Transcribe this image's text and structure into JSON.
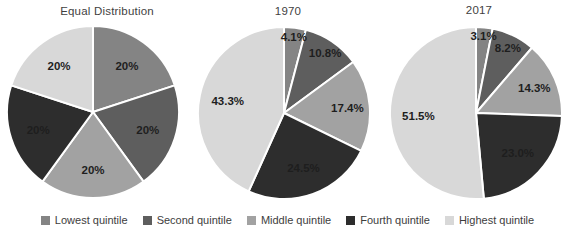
{
  "panel": {
    "background": "#ffffff",
    "label_color": "#1e1e1e",
    "divider_color": "#ffffff",
    "title_color": "#3f3f3f"
  },
  "legend": {
    "position": "bottom",
    "items": [
      {
        "label": "Lowest quintile",
        "color": "#848484"
      },
      {
        "label": "Second quintile",
        "color": "#5e5e5e"
      },
      {
        "label": "Middle quintile",
        "color": "#a2a2a2"
      },
      {
        "label": "Fourth quintile",
        "color": "#2d2d2d"
      },
      {
        "label": "Highest quintile",
        "color": "#d8d8d8"
      }
    ]
  },
  "chart_data": [
    {
      "type": "pie",
      "title": "Equal Distribution",
      "categories": [
        "Lowest quintile",
        "Second quintile",
        "Middle quintile",
        "Fourth quintile",
        "Highest quintile"
      ],
      "values": [
        20,
        20,
        20,
        20,
        20
      ],
      "labels": [
        "20%",
        "20%",
        "20%",
        "20%",
        "20%"
      ],
      "colors": [
        "#848484",
        "#5e5e5e",
        "#a2a2a2",
        "#2d2d2d",
        "#d8d8d8"
      ],
      "start_angle_deg": 0,
      "direction": "clockwise",
      "legend_position": "bottom"
    },
    {
      "type": "pie",
      "title": "1970",
      "categories": [
        "Lowest quintile",
        "Second quintile",
        "Middle quintile",
        "Fourth quintile",
        "Highest quintile"
      ],
      "values": [
        4.1,
        10.8,
        17.4,
        24.5,
        43.3
      ],
      "labels": [
        "4.1%",
        "10.8%",
        "17.4%",
        "24.5%",
        "43.3%"
      ],
      "colors": [
        "#848484",
        "#5e5e5e",
        "#a2a2a2",
        "#2d2d2d",
        "#d8d8d8"
      ],
      "start_angle_deg": 0,
      "direction": "clockwise",
      "legend_position": "bottom"
    },
    {
      "type": "pie",
      "title": "2017",
      "categories": [
        "Lowest quintile",
        "Second quintile",
        "Middle quintile",
        "Fourth quintile",
        "Highest quintile"
      ],
      "values": [
        3.1,
        8.2,
        14.3,
        23.0,
        51.5
      ],
      "labels": [
        "3.1%",
        "8.2%",
        "14.3%",
        "23.0%",
        "51.5%"
      ],
      "colors": [
        "#848484",
        "#5e5e5e",
        "#a2a2a2",
        "#2d2d2d",
        "#d8d8d8"
      ],
      "start_angle_deg": 0,
      "direction": "clockwise",
      "legend_position": "bottom"
    }
  ]
}
